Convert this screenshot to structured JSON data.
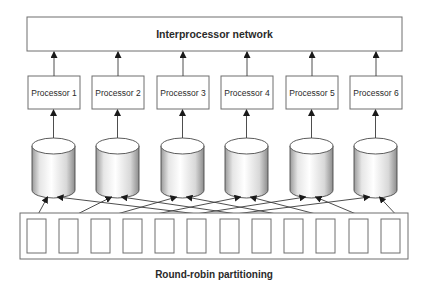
{
  "network": {
    "title": "Interprocessor network",
    "box": {
      "x": 27,
      "y": 17,
      "w": 375,
      "h": 34
    }
  },
  "processors": [
    {
      "label": "Processor 1",
      "x": 28
    },
    {
      "label": "Processor 2",
      "x": 92
    },
    {
      "label": "Processor 3",
      "x": 157
    },
    {
      "label": "Processor 4",
      "x": 221
    },
    {
      "label": "Processor 5",
      "x": 286
    },
    {
      "label": "Processor 6",
      "x": 350
    }
  ],
  "processor_box": {
    "y": 76,
    "w": 52,
    "h": 33
  },
  "disks": {
    "count": 6,
    "x": [
      32,
      96,
      161,
      225,
      290,
      354
    ],
    "w": 43,
    "top_y": 146,
    "ry": 8,
    "bottom_y": 190
  },
  "partition_box": {
    "x": 20,
    "y": 213,
    "w": 388,
    "h": 46
  },
  "records": {
    "count": 12,
    "x": [
      27,
      59,
      91,
      123,
      155,
      187,
      220,
      252,
      284,
      316,
      349,
      381
    ],
    "y": 219,
    "w": 19,
    "h": 34
  },
  "round_robin_map": [
    0,
    1,
    2,
    3,
    4,
    5,
    0,
    1,
    2,
    3,
    4,
    5
  ],
  "footer": {
    "title": "Round-robin partitioning"
  },
  "colors": {
    "stroke": "#3a3a3a",
    "box_border": "#6e6e6e",
    "text": "#2a2a2a"
  }
}
